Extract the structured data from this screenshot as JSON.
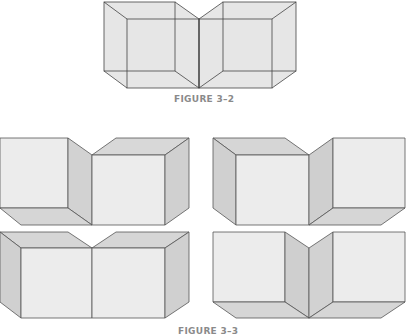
{
  "figures": [
    {
      "id": "figure-3-2",
      "caption": "FIGURE 3–2",
      "description": "Transparent wireframe of two joined cubes with a central fold"
    },
    {
      "id": "figure-3-3",
      "caption": "FIGURE 3–3",
      "description": "Four shaded views of two adjoining cubes in different orientations"
    }
  ],
  "colors": {
    "front_face": "#ececec",
    "light_face": "#e2e2e2",
    "dark_face": "#cfcfcf",
    "wire_fill": "#e6e6e6",
    "stroke": "#444444",
    "caption": "#8a8a8a"
  }
}
